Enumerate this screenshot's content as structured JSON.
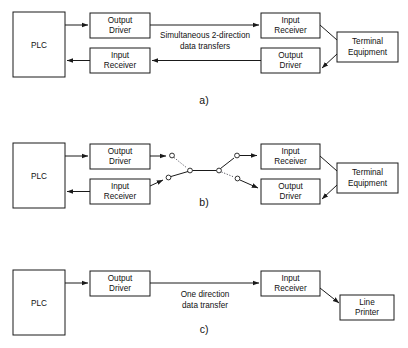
{
  "diagram": {
    "line_color": "#1a1a1a",
    "background_color": "#ffffff",
    "sections": [
      {
        "id": "a",
        "caption": "a)",
        "flow_label_line1": "Simultaneous 2-direction",
        "flow_label_line2": "data transfers",
        "boxes": {
          "plc": "PLC",
          "output_driver_left_line1": "Output",
          "output_driver_left_line2": "Driver",
          "input_receiver_left_line1": "Input",
          "input_receiver_left_line2": "Receiver",
          "input_receiver_right_line1": "Input",
          "input_receiver_right_line2": "Receiver",
          "output_driver_right_line1": "Output",
          "output_driver_right_line2": "Driver",
          "endpoint_line1": "Terminal",
          "endpoint_line2": "Equipment"
        }
      },
      {
        "id": "b",
        "caption": "b)",
        "flow_label_line1": "",
        "flow_label_line2": "",
        "boxes": {
          "plc": "PLC",
          "output_driver_left_line1": "Output",
          "output_driver_left_line2": "Driver",
          "input_receiver_left_line1": "Input",
          "input_receiver_left_line2": "Receiver",
          "input_receiver_right_line1": "Input",
          "input_receiver_right_line2": "Receiver",
          "output_driver_right_line1": "Output",
          "output_driver_right_line2": "Driver",
          "endpoint_line1": "Terminal",
          "endpoint_line2": "Equipment"
        }
      },
      {
        "id": "c",
        "caption": "c)",
        "flow_label_line1": "One direction",
        "flow_label_line2": "data transfer",
        "boxes": {
          "plc": "PLC",
          "output_driver_left_line1": "Output",
          "output_driver_left_line2": "Driver",
          "input_receiver_right_line1": "Input",
          "input_receiver_right_line2": "Receiver",
          "endpoint_line1": "Line",
          "endpoint_line2": "Printer"
        }
      }
    ]
  }
}
